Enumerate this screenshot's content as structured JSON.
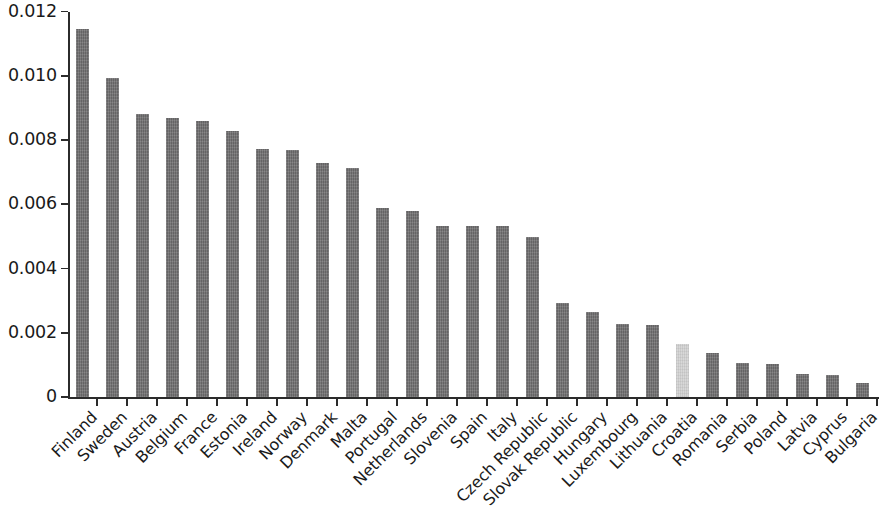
{
  "chart_data": {
    "type": "bar",
    "title": "",
    "subtitle": "",
    "xlabel": "",
    "ylabel": "",
    "ylim": [
      0,
      0.012
    ],
    "grid": false,
    "legend": "none",
    "y_ticks": [
      "0",
      "0.002",
      "0.004",
      "0.006",
      "0.008",
      "0.010",
      "0.012"
    ],
    "y_tick_values": [
      0,
      0.002,
      0.004,
      0.006,
      0.008,
      0.01,
      0.012
    ],
    "categories": [
      "Finland",
      "Sweden",
      "Austria",
      "Belgium",
      "France",
      "Estonia",
      "Ireland",
      "Norway",
      "Denmark",
      "Malta",
      "Portugal",
      "Netherlands",
      "Slovenia",
      "Spain",
      "Italy",
      "Czech Republic",
      "Slovak Republic",
      "Hungary",
      "Luxembourg",
      "Lithuania",
      "Croatia",
      "Romania",
      "Serbia",
      "Poland",
      "Latvia",
      "Cyprus",
      "Bulgaria"
    ],
    "values": [
      0.01146,
      0.00993,
      0.0088,
      0.00868,
      0.0086,
      0.00827,
      0.00771,
      0.0077,
      0.0073,
      0.00712,
      0.00588,
      0.00578,
      0.00533,
      0.00532,
      0.00532,
      0.00497,
      0.00292,
      0.00266,
      0.00228,
      0.00224,
      0.00165,
      0.00137,
      0.00106,
      0.00102,
      0.00073,
      0.0007,
      0.00045
    ],
    "highlighted_category": "Croatia",
    "colors": {
      "bar": "#706f70",
      "bar_highlight": "#d4d4d4",
      "axis": "#2b2b2b",
      "text": "#1a1a1a",
      "background": "#ffffff"
    }
  }
}
